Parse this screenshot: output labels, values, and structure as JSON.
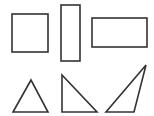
{
  "diagram": {
    "title": "",
    "stroke_color": "#333333",
    "background": "#ffffff",
    "shapes": [
      {
        "id": "square",
        "type": "rect",
        "x": 12,
        "y": 14,
        "w": 36,
        "h": 38
      },
      {
        "id": "tall-rectangle",
        "type": "rect",
        "x": 61,
        "y": 5,
        "w": 19,
        "h": 56
      },
      {
        "id": "wide-rectangle",
        "type": "rect",
        "x": 92,
        "y": 18,
        "w": 55,
        "h": 29
      },
      {
        "id": "equilateral-triangle",
        "type": "polygon",
        "points": "31,80 13,112 48,112"
      },
      {
        "id": "right-triangle",
        "type": "polygon",
        "points": "62,75 62,112 97,112"
      },
      {
        "id": "obtuse-triangle",
        "type": "polygon",
        "points": "146,65 134,112 106,112"
      }
    ]
  }
}
